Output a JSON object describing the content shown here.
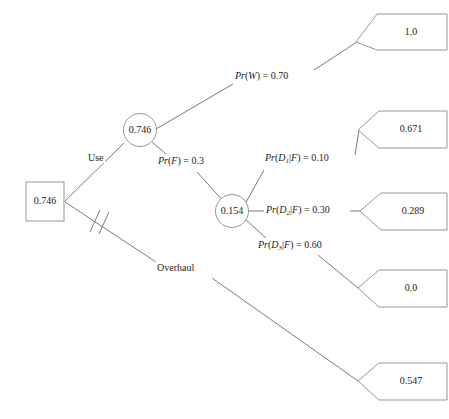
{
  "diagram": {
    "type": "decision-tree",
    "title": "",
    "root": {
      "shape": "square",
      "name": "decision-node",
      "value": "0.746"
    },
    "nodes": [
      {
        "id": "use-chance",
        "shape": "circle",
        "value": "0.746"
      },
      {
        "id": "failure-chance",
        "shape": "circle",
        "value": "0.154"
      }
    ],
    "branch_labels": {
      "use": "Use",
      "overhaul": "Overhaul",
      "pr_w": "Pr(W) = 0.70",
      "pr_f": "Pr(F) = 0.3",
      "pr_d1": "Pr(D1|F) = 0.10",
      "pr_d2": "Pr(D2|F) = 0.30",
      "pr_d3": "Pr(D3|F) = 0.60"
    },
    "branch_label_parts": {
      "pr_w": {
        "fn": "Pr",
        "arg": "W",
        "eq": " = 0.70"
      },
      "pr_f": {
        "fn": "Pr",
        "arg": "F",
        "eq": " = 0.3"
      },
      "pr_d1": {
        "fn": "Pr",
        "arg": "D",
        "sub": "1",
        "cond": "F",
        "eq": " = 0.10"
      },
      "pr_d2": {
        "fn": "Pr",
        "arg": "D",
        "sub": "2",
        "cond": "F",
        "eq": " = 0.30"
      },
      "pr_d3": {
        "fn": "Pr",
        "arg": "D",
        "sub": "3",
        "cond": "F",
        "eq": " = 0.60"
      }
    },
    "terminals": [
      {
        "id": "payoff-w",
        "value": "1.0"
      },
      {
        "id": "payoff-d1",
        "value": "0.671"
      },
      {
        "id": "payoff-d2",
        "value": "0.289"
      },
      {
        "id": "payoff-d3",
        "value": "0.0"
      },
      {
        "id": "payoff-overhaul",
        "value": "0.547"
      }
    ],
    "markers": {
      "pruned_branch": "double-slash"
    },
    "colors": {
      "line": "#6b6b6b",
      "node_border": "#8a8a8a",
      "text": "#1d1d1d",
      "background": "#ffffff"
    }
  }
}
